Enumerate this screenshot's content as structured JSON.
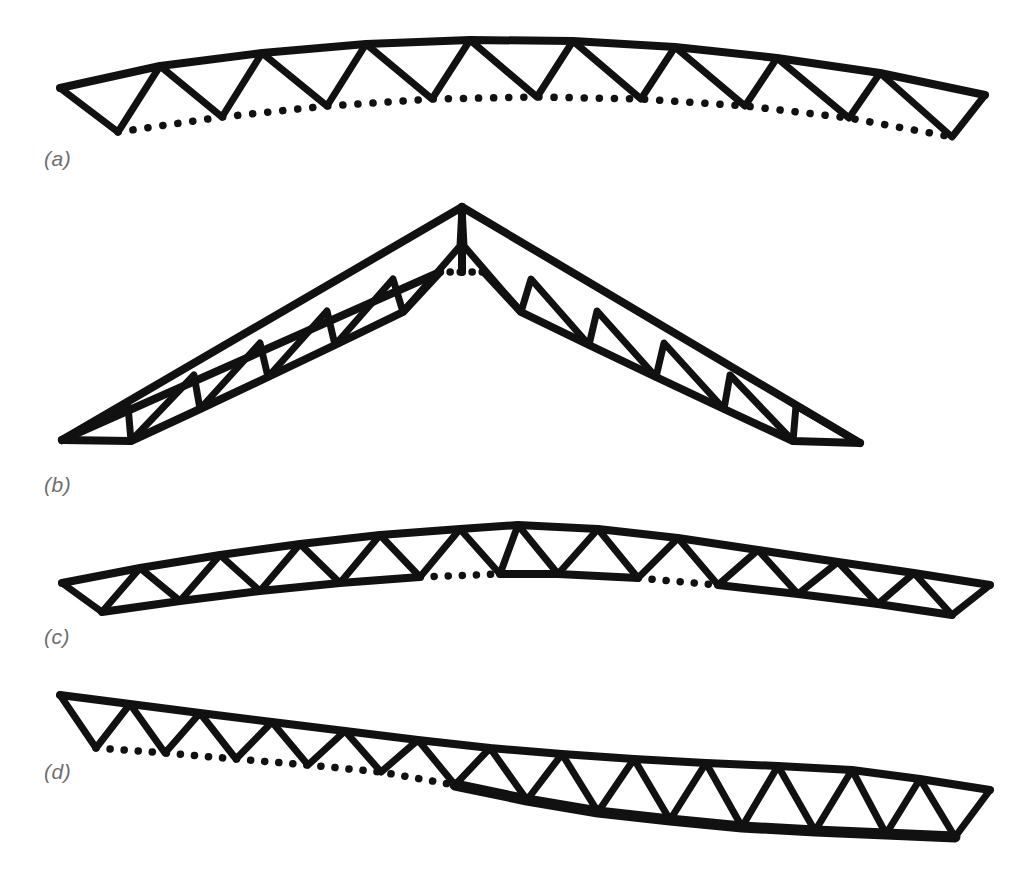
{
  "figure": {
    "background_color": "#ffffff",
    "line_color": "#111111",
    "label_color": "#6e6e6e"
  },
  "labels": {
    "a": "(a)",
    "b": "(b)",
    "c": "(c)",
    "d": "(d)"
  },
  "diagrams": [
    {
      "id": "truss-a",
      "label": "(a)",
      "description": "Bowstring truss with cambered solid top chord, dotted bottom chord and warren web",
      "top_chord_style": "solid",
      "bottom_chord_style": "dotted",
      "panel_count": 12,
      "span_px": 925,
      "left_end": [
        60,
        88
      ],
      "right_end": [
        985,
        95
      ],
      "top_chord_points": "60,88 160,66 262,53 366,44 470,40 573,41 675,47 777,58 880,73 985,95",
      "bottom_chord_points": "118,132 222,117 327,106 432,99 537,97 641,99 745,106 849,118 952,137",
      "bottom_chord_dash": "dotted",
      "web_vertices_top": [
        60,
        160,
        262,
        366,
        470,
        573,
        675,
        777,
        880,
        985
      ],
      "web_vertices_bottom": [
        118,
        222,
        327,
        432,
        537,
        641,
        745,
        849,
        952
      ]
    },
    {
      "id": "truss-b",
      "label": "(b)",
      "description": "Gabled scissors-free pitched truss, parallel chords, vertical member at apex, short dotted gap in bottom chord at ridge",
      "top_chord_style": "solid",
      "bottom_chord_style": "solid",
      "apex": [
        462,
        207
      ],
      "left_end": [
        62,
        440
      ],
      "right_end": [
        860,
        443
      ],
      "panel_count_per_slope": 6,
      "bottom_gap_style": "dotted",
      "bottom_gap_dot_count": 3
    },
    {
      "id": "truss-c",
      "label": "(c)",
      "description": "Cambered truss with alternating solid and dotted segments along the bottom chord",
      "top_chord_style": "solid",
      "bottom_chord_style": "mixed-solid-and-dotted",
      "panel_count": 12,
      "left_end": [
        62,
        583
      ],
      "right_end": [
        990,
        585
      ],
      "bottom_segments": [
        {
          "style": "solid",
          "from": 0,
          "to": 4
        },
        {
          "style": "dotted",
          "from": 4,
          "to": 5
        },
        {
          "style": "solid",
          "from": 5,
          "to": 7
        },
        {
          "style": "dotted",
          "from": 7,
          "to": 8
        },
        {
          "style": "solid",
          "from": 8,
          "to": 12
        }
      ]
    },
    {
      "id": "truss-d",
      "label": "(d)",
      "description": "S-curved (ogee) truss: dotted bottom chord on the left half changing to a heavy solid bottom chord on the right half",
      "top_chord_style": "solid",
      "bottom_chord_style": "dotted-left-solid-right",
      "panel_count": 13,
      "left_end": [
        60,
        695
      ],
      "right_end": [
        990,
        790
      ],
      "transition_x": 455,
      "bottom_left_style": "dotted",
      "bottom_right_style": "solid-heavy"
    }
  ],
  "legend": {
    "solid_member": "Solid line = physical truss member",
    "dotted_member": "Dotted line = implied / omitted bottom chord"
  }
}
